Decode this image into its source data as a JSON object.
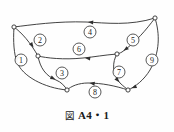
{
  "figure": {
    "caption_mark": "図",
    "caption_text": "A4・1",
    "background_color": "#fefefe",
    "ink_color": "#2e2e2e"
  },
  "chart_data": {
    "type": "diagram",
    "subtype": "directed-graph",
    "grid": false,
    "legend": "none",
    "xlim": [
      0,
      174
    ],
    "ylim": [
      0,
      132
    ],
    "vertices": [
      {
        "id": "A",
        "x": 14,
        "y": 27,
        "label": ""
      },
      {
        "id": "B",
        "x": 38,
        "y": 56,
        "label": ""
      },
      {
        "id": "C",
        "x": 67,
        "y": 90,
        "label": ""
      },
      {
        "id": "D",
        "x": 117,
        "y": 54,
        "label": ""
      },
      {
        "id": "E",
        "x": 128,
        "y": 90,
        "label": ""
      },
      {
        "id": "F",
        "x": 155,
        "y": 18,
        "label": ""
      }
    ],
    "edges": [
      {
        "id": 1,
        "label": "1",
        "from": "A",
        "to": "C",
        "directed": true,
        "label_x": 21,
        "label_y": 60,
        "path": "M 14 27 C 13 42, 14 54, 17 62 C 22 76, 44 88, 67 90",
        "arrow_x": 16.6,
        "arrow_y": 61.5,
        "arrow_angle": 102
      },
      {
        "id": 2,
        "label": "2",
        "from": "A",
        "to": "B",
        "directed": true,
        "label_x": 40,
        "label_y": 40,
        "path": "M 14 27 C 22 33, 30 42, 38 56",
        "arrow_x": 33.5,
        "arrow_y": 47.5,
        "arrow_angle": 56
      },
      {
        "id": 3,
        "label": "3",
        "from": "B",
        "to": "C",
        "directed": true,
        "label_x": 62,
        "label_y": 73,
        "path": "M 38 56 C 40 68, 46 76, 56 80 C 61 82, 65 86, 67 90",
        "arrow_x": 55.5,
        "arrow_y": 79.6,
        "arrow_angle": 26
      },
      {
        "id": 4,
        "label": "4",
        "from": "F",
        "to": "A",
        "directed": true,
        "label_x": 90,
        "label_y": 32,
        "path": "M 155 18 C 130 26, 106 23, 86 22 C 58 21, 30 25, 14 27",
        "arrow_x": 88,
        "arrow_y": 22.1,
        "arrow_angle": 184
      },
      {
        "id": 5,
        "label": "5",
        "from": "F",
        "to": "D",
        "directed": true,
        "label_x": 133,
        "label_y": 40,
        "path": "M 155 18 C 146 30, 136 42, 122 52 C 120 53, 118 54, 117 54",
        "arrow_x": 123.5,
        "arrow_y": 50.8,
        "arrow_angle": 144
      },
      {
        "id": 6,
        "label": "6",
        "from": "D",
        "to": "B",
        "directed": true,
        "label_x": 79,
        "label_y": 49,
        "path": "M 117 54 C 104 55, 94 57, 83 58 C 64 60, 46 58, 38 56",
        "arrow_x": 85,
        "arrow_y": 58,
        "arrow_angle": 187
      },
      {
        "id": 7,
        "label": "7",
        "from": "D",
        "to": "E",
        "directed": true,
        "label_x": 119,
        "label_y": 72,
        "path": "M 117 54 C 112 62, 112 74, 120 83 C 123 86, 126 88, 128 90",
        "arrow_x": 119.3,
        "arrow_y": 82.2,
        "arrow_angle": 50
      },
      {
        "id": 8,
        "label": "8",
        "from": "E",
        "to": "C",
        "directed": true,
        "label_x": 95,
        "label_y": 92,
        "path": "M 128 90 C 116 86, 102 83, 88 83 C 79 83, 71 86, 67 90",
        "arrow_x": 89.5,
        "arrow_y": 83.1,
        "arrow_angle": 187
      },
      {
        "id": 9,
        "label": "9",
        "from": "F",
        "to": "E",
        "directed": true,
        "label_x": 152,
        "label_y": 60,
        "path": "M 155 18 C 160 34, 160 52, 150 70 C 144 80, 135 87, 128 90",
        "arrow_x": 131.5,
        "arrow_y": 88.2,
        "arrow_angle": 158
      }
    ]
  }
}
